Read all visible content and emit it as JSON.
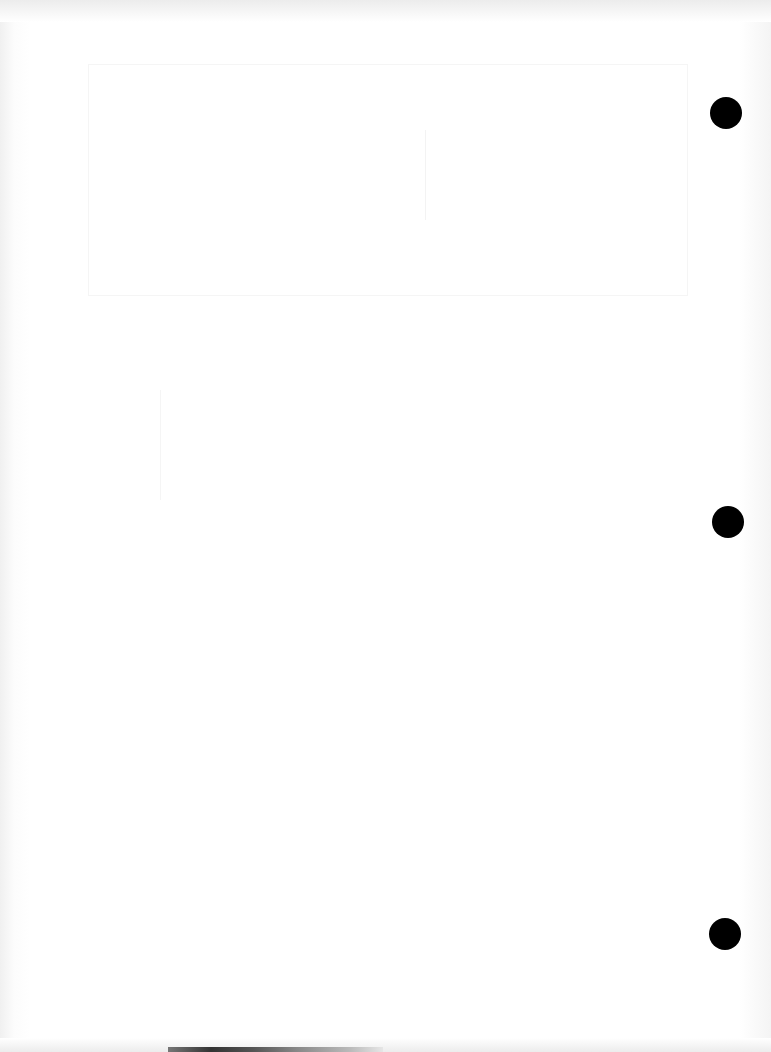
{
  "page": {
    "background_color": "#ffffff",
    "hole_color": "#000000",
    "punch_holes": [
      {
        "name": "top",
        "x": 710,
        "y": 97
      },
      {
        "name": "middle",
        "x": 712,
        "y": 506
      },
      {
        "name": "bottom",
        "x": 709,
        "y": 918
      }
    ]
  }
}
